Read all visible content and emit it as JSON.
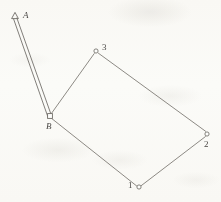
{
  "figure": {
    "kind": "surveying-traverse-diagram",
    "canvas": {
      "width": 221,
      "height": 202
    },
    "background_color": "#fdfdfb",
    "ink_color": "#6e6b66",
    "label_color": "#4a4845",
    "top_text_bleed": "一 基 于 方 向 的 导 线   平 差 计 算 方 法   精 度 分 析 与",
    "points": [
      {
        "id": "A",
        "label": "A",
        "label_style": "italic",
        "marker": "triangle",
        "marker_name": "triangulation-station-marker",
        "x": 15,
        "y": 16,
        "label_x": 23,
        "label_y": 10
      },
      {
        "id": "B",
        "label": "B",
        "label_style": "italic",
        "marker": "square",
        "marker_name": "control-point-marker",
        "x": 50,
        "y": 116,
        "label_x": 46,
        "label_y": 121
      },
      {
        "id": "3",
        "label": "3",
        "label_style": "normal",
        "marker": "circle",
        "marker_name": "traverse-point-marker",
        "x": 96,
        "y": 51,
        "label_x": 102,
        "label_y": 42
      },
      {
        "id": "2",
        "label": "2",
        "label_style": "normal",
        "marker": "circle",
        "marker_name": "traverse-point-marker",
        "x": 207,
        "y": 134,
        "label_x": 204,
        "label_y": 139
      },
      {
        "id": "1",
        "label": "1",
        "label_style": "normal",
        "marker": "circle",
        "marker_name": "traverse-point-marker",
        "x": 139,
        "y": 187,
        "label_x": 128,
        "label_y": 180
      }
    ],
    "edges": [
      {
        "from": "A",
        "to": "B",
        "style": "double-line",
        "name": "baseline-a-b"
      },
      {
        "from": "B",
        "to": "3",
        "style": "single-line",
        "name": "traverse-leg-b-3"
      },
      {
        "from": "3",
        "to": "2",
        "style": "single-line",
        "name": "traverse-leg-3-2"
      },
      {
        "from": "2",
        "to": "1",
        "style": "single-line",
        "name": "traverse-leg-2-1"
      },
      {
        "from": "1",
        "to": "B",
        "style": "single-line",
        "name": "traverse-leg-1-b"
      }
    ]
  }
}
